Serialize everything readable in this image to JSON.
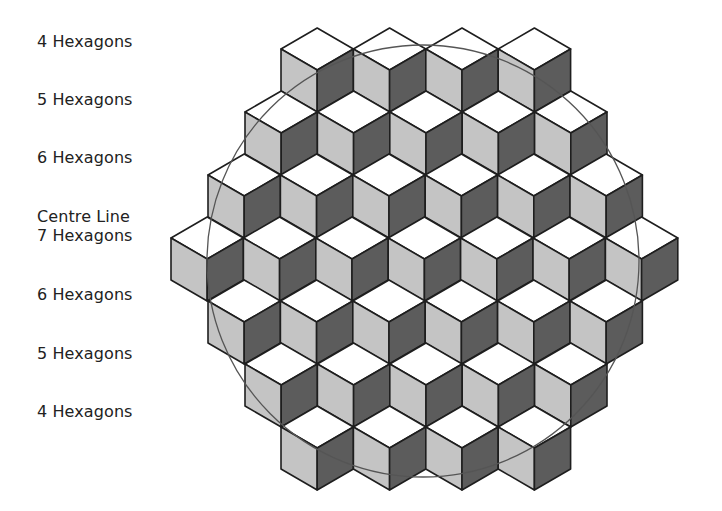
{
  "labels": [
    {
      "text": "4 Hexagons",
      "top": 33
    },
    {
      "text": "5 Hexagons",
      "top": 91
    },
    {
      "text": "6 Hexagons",
      "top": 149
    },
    {
      "text": "Centre Line",
      "top": 208
    },
    {
      "text": "7 Hexagons",
      "top": 227
    },
    {
      "text": "6 Hexagons",
      "top": 286
    },
    {
      "text": "5 Hexagons",
      "top": 345
    },
    {
      "text": "4 Hexagons",
      "top": 403
    }
  ],
  "grid": {
    "half_width": 36.2,
    "half_height": 21,
    "side_height": 42,
    "rows": [
      {
        "count": 4,
        "left_x": 281,
        "top_y": 28
      },
      {
        "count": 5,
        "left_x": 245,
        "top_y": 91
      },
      {
        "count": 6,
        "left_x": 208,
        "top_y": 154
      },
      {
        "count": 7,
        "left_x": 171,
        "top_y": 217
      },
      {
        "count": 6,
        "left_x": 208,
        "top_y": 280
      },
      {
        "count": 5,
        "left_x": 245,
        "top_y": 343
      },
      {
        "count": 4,
        "left_x": 281,
        "top_y": 406
      }
    ]
  },
  "circle": {
    "cx": 423,
    "cy": 261,
    "r": 216
  },
  "colors": {
    "top_face": "#ffffff",
    "left_face": "#c4c4c4",
    "right_face": "#5c5c5c",
    "edge": "#1e1e1e",
    "circle": "#555555"
  }
}
